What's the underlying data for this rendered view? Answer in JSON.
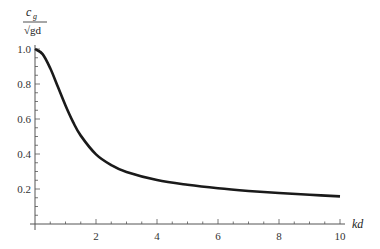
{
  "chart_data": {
    "type": "line",
    "title": "",
    "xlabel": "kd",
    "ylabel": "c_g / √(gd)",
    "ylabel_parts": {
      "numerator": "c",
      "subscript": "g",
      "denominator": "√gd"
    },
    "xlim": [
      0,
      10
    ],
    "ylim": [
      0,
      1.0
    ],
    "x_ticks": [
      2,
      4,
      6,
      8,
      10
    ],
    "x_tick_labels": [
      "2",
      "4",
      "6",
      "8",
      "10"
    ],
    "y_ticks": [
      0.2,
      0.4,
      0.6,
      0.8,
      1.0
    ],
    "y_tick_labels": [
      "0.2",
      "0.4",
      "0.6",
      "0.8",
      "1.0"
    ],
    "grid": false,
    "legend": null,
    "series": [
      {
        "name": "group velocity",
        "x": [
          0,
          0.25,
          0.5,
          0.75,
          1,
          1.25,
          1.5,
          2,
          2.5,
          3,
          4,
          5,
          6,
          7,
          8,
          9,
          10
        ],
        "values": [
          1.0,
          0.971,
          0.89,
          0.784,
          0.677,
          0.582,
          0.505,
          0.398,
          0.337,
          0.297,
          0.251,
          0.224,
          0.204,
          0.189,
          0.177,
          0.167,
          0.158
        ]
      }
    ]
  }
}
